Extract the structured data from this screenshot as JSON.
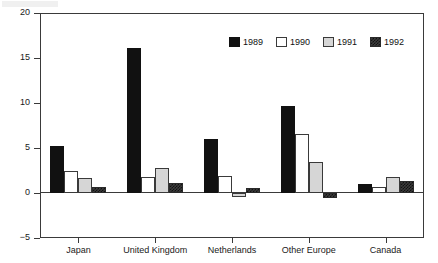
{
  "chart_data": {
    "type": "bar",
    "title": "",
    "subtitle": "",
    "xlabel": "",
    "ylabel": "",
    "categories": [
      "Japan",
      "United Kingdom",
      "Netherlands",
      "Other Europe",
      "Canada"
    ],
    "series": [
      {
        "name": "1989",
        "color": "#111111",
        "fill": "solid-black",
        "values": [
          5.25,
          16.1,
          6.0,
          9.7,
          1.0
        ]
      },
      {
        "name": "1990",
        "color": "#ffffff",
        "fill": "open-white",
        "values": [
          2.4,
          1.8,
          1.9,
          6.6,
          0.7
        ]
      },
      {
        "name": "1991",
        "color": "#d6d6d6",
        "fill": "light-stipple",
        "values": [
          1.7,
          2.8,
          -0.4,
          3.4,
          1.8
        ]
      },
      {
        "name": "1992",
        "color": "#3b3b3b",
        "fill": "dark-checker",
        "values": [
          0.7,
          1.1,
          0.6,
          -0.6,
          1.3
        ]
      }
    ],
    "ylim": [
      -5,
      20
    ],
    "yticks": [
      20,
      15,
      10,
      5,
      0,
      -5
    ],
    "yticklabels": [
      "20",
      "15",
      "10",
      "5",
      "0",
      "−5"
    ],
    "grid": false,
    "legend_position": "top-right",
    "legend_entries": [
      "1989",
      "1990",
      "1991",
      "1992"
    ],
    "zero_line": 0
  },
  "legend": {
    "items": [
      {
        "label": "1989"
      },
      {
        "label": "1990"
      },
      {
        "label": "1991"
      },
      {
        "label": "1992"
      }
    ]
  }
}
